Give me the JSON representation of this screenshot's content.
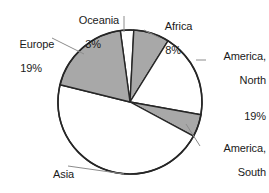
{
  "chart_data": {
    "type": "pie",
    "title": "",
    "subtitle": "",
    "xlabel": "",
    "ylabel": "",
    "legend_position": "none",
    "grid": false,
    "labels_outside": true,
    "value_suffix": "%",
    "categories": [
      "Oceania",
      "Africa",
      "America, North",
      "America, South",
      "Asia",
      "Europe"
    ],
    "values": [
      3,
      8,
      19,
      5,
      46,
      19
    ],
    "slices": [
      {
        "name": "Oceania",
        "label": "Oceania",
        "value": 3,
        "value_text": "3%",
        "fill": "#ffffff",
        "stroke": "#262626",
        "start_angle": 352,
        "end_angle": 3
      },
      {
        "name": "Africa",
        "label": "Africa",
        "value": 8,
        "value_text": "8%",
        "fill": "#a8a8a8",
        "stroke": "#262626",
        "start_angle": 3,
        "end_angle": 32
      },
      {
        "name": "America, North",
        "label": "America,\nNorth",
        "value": 19,
        "value_text": "19%",
        "fill": "#ffffff",
        "stroke": "#262626",
        "start_angle": 32,
        "end_angle": 100
      },
      {
        "name": "America, South",
        "label": "America,\nSouth",
        "value": 5,
        "value_text": "5%",
        "fill": "#a8a8a8",
        "stroke": "#262626",
        "start_angle": 100,
        "end_angle": 118
      },
      {
        "name": "Asia",
        "label": "Asia",
        "value": 46,
        "value_text": "46%",
        "fill": "#ffffff",
        "stroke": "#262626",
        "start_angle": 118,
        "end_angle": 284
      },
      {
        "name": "Europe",
        "label": "Europe",
        "value": 19,
        "value_text": "19%",
        "fill": "#a8a8a8",
        "stroke": "#262626",
        "start_angle": 284,
        "end_angle": 352
      }
    ],
    "colors": {
      "gray_slice": "#a8a8a8",
      "white_slice": "#ffffff",
      "outline": "#262626",
      "leader_line": "#8c8c8c",
      "text": "#1a1a1a",
      "background": "#ffffff"
    },
    "geometry": {
      "cx": 130,
      "cy": 102,
      "r": 72
    }
  },
  "labels": {
    "oceania": {
      "name": "Oceania",
      "pct": "3%"
    },
    "africa": {
      "name": "Africa",
      "pct": "8%"
    },
    "america_north": {
      "line1": "America,",
      "line2": "North",
      "pct": "19%"
    },
    "america_south": {
      "line1": "America,",
      "line2": "South",
      "pct": "5%"
    },
    "asia": {
      "name": "Asia",
      "pct": "46%"
    },
    "europe": {
      "name": "Europe",
      "pct": "19%"
    }
  }
}
